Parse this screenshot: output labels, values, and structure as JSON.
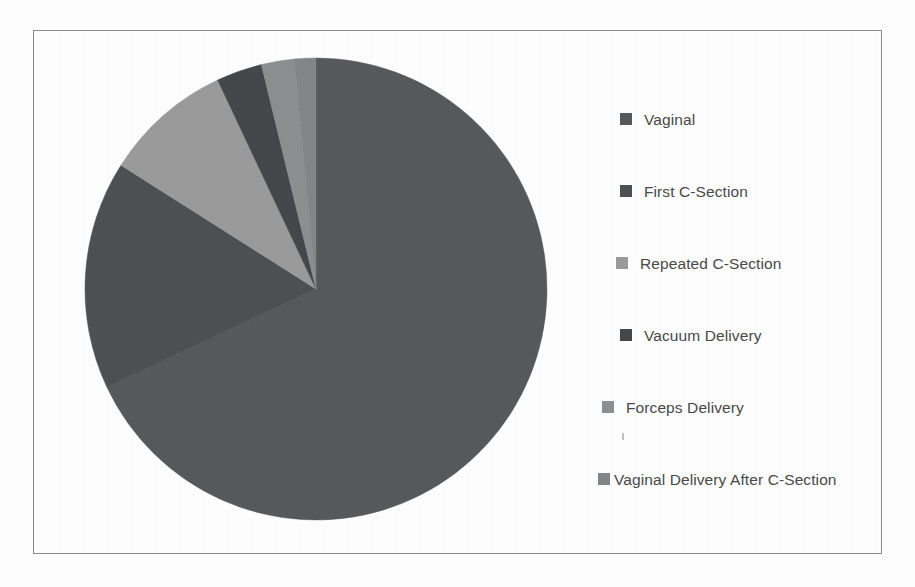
{
  "figure": {
    "background_color": "#fdfdfd",
    "frame_color": "#8b8b8b"
  },
  "legend": {
    "position": "right",
    "items": [
      {
        "label": "Vaginal",
        "color": "#58595b",
        "indent": "wide",
        "top": 44,
        "swatch_name": "legend-swatch-vaginal"
      },
      {
        "label": "First C-Section",
        "color": "#4f5052",
        "indent": "wide",
        "top": 116,
        "swatch_name": "legend-swatch-first-c-section"
      },
      {
        "label": "Repeated C-Section",
        "color": "#9b9b9b",
        "indent": "mid",
        "top": 188,
        "swatch_name": "legend-swatch-repeated-c-section"
      },
      {
        "label": "Vacuum Delivery",
        "color": "#46474a",
        "indent": "wide",
        "top": 260,
        "swatch_name": "legend-swatch-vacuum-delivery"
      },
      {
        "label": "Forceps Delivery",
        "color": "#8e8f91",
        "indent": "small",
        "top": 332,
        "swatch_name": "legend-swatch-forceps-delivery"
      },
      {
        "label": "Vaginal Delivery After C-Section",
        "color": "#858688",
        "indent": "tiny",
        "top": 404,
        "swatch_name": "legend-swatch-vbac"
      }
    ]
  },
  "chart_data": {
    "type": "pie",
    "title": "",
    "categories": [
      "Vaginal",
      "First C-Section",
      "Repeated C-Section",
      "Vacuum Delivery",
      "Forceps Delivery",
      "Vaginal Delivery After C-Section"
    ],
    "values": [
      68.0,
      16.0,
      9.0,
      3.2,
      2.3,
      1.5
    ],
    "unit": "percent",
    "colors": [
      "#58595b",
      "#4f5052",
      "#9b9b9b",
      "#46474a",
      "#8e8f91",
      "#858688"
    ],
    "start_angle_deg": 0,
    "direction": "clockwise",
    "labels_shown": false,
    "data_labels": false,
    "grid": false,
    "legend_position": "right",
    "geometry": {
      "center_x": 233,
      "center_y": 233,
      "radius": 231
    }
  }
}
